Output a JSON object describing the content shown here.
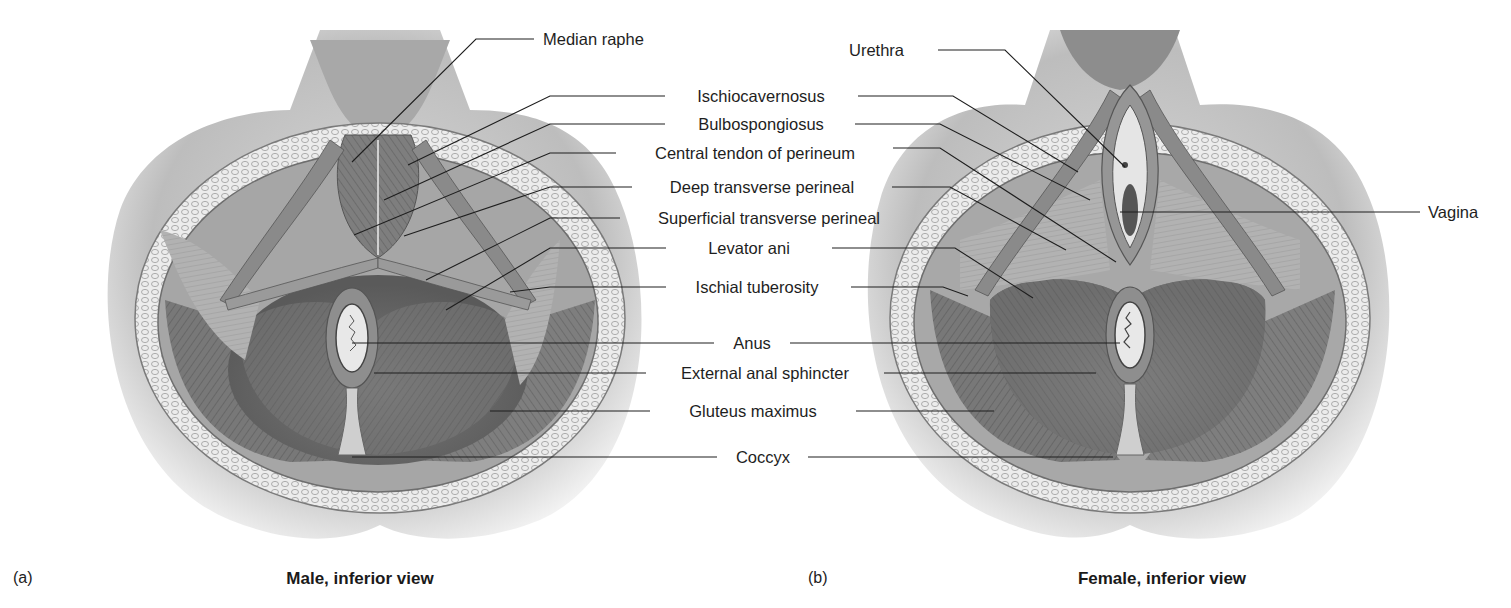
{
  "figure": {
    "panels": [
      {
        "id": "a",
        "letter": "(a)",
        "caption": "Male, inferior view"
      },
      {
        "id": "b",
        "letter": "(b)",
        "caption": "Female, inferior view"
      }
    ],
    "center_labels": [
      "Ischiocavernosus",
      "Bulbospongiosus",
      "Central tendon of perineum",
      "Deep transverse perineal",
      "Superficial transverse perineal",
      "Levator ani",
      "Ischial tuberosity",
      "Anus",
      "External anal sphincter",
      "Gluteus maximus",
      "Coccyx"
    ],
    "male_only_labels": [
      "Median raphe"
    ],
    "female_only_labels": [
      "Urethra",
      "Vagina"
    ],
    "colors": {
      "background": "#ffffff",
      "leader_line": "#1e1e1e",
      "skin_shade": "#bdbdbd",
      "fat_layer": "#e6e6e6",
      "muscle_dark": "#6a6a6a",
      "muscle_mid": "#8c8c8c"
    }
  }
}
